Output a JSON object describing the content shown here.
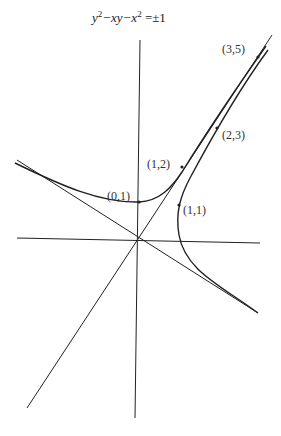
{
  "diagram": {
    "title": {
      "y": "y",
      "sup1": "2",
      "mid": "−xy−x",
      "sup2": "2",
      "rhs": " =±1"
    },
    "points": [
      {
        "label": "(0,1)"
      },
      {
        "label": "(1,2)"
      },
      {
        "label": "(1,1)"
      },
      {
        "label": "(2,3)"
      },
      {
        "label": "(3,5)"
      }
    ],
    "curves": [
      {
        "name": "hyperbola branch y²−xy−x²=1"
      },
      {
        "name": "hyperbola branch y²−xy−x²=−1"
      },
      {
        "name": "asymptote slope golden ratio"
      },
      {
        "name": "asymptote slope negative"
      }
    ],
    "colors": {
      "stroke": "#222222",
      "background": "#ffffff"
    }
  }
}
